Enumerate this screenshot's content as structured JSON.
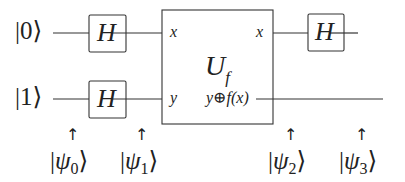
{
  "diagram": {
    "type": "quantum-circuit",
    "colors": {
      "line": "#333333",
      "text": "#222222",
      "background": "#ffffff"
    },
    "inputs": [
      {
        "ket": "|0⟩",
        "value": "0"
      },
      {
        "ket": "|1⟩",
        "value": "1"
      }
    ],
    "gates": [
      {
        "id": "h-top-1",
        "label": "H",
        "wire": 0
      },
      {
        "id": "h-bottom-1",
        "label": "H",
        "wire": 1
      },
      {
        "id": "uf",
        "label": "U",
        "subscript": "f",
        "inputs": [
          "x",
          "y"
        ],
        "outputs": [
          "x",
          "y⊕f(x)"
        ]
      },
      {
        "id": "h-top-2",
        "label": "H",
        "wire": 0
      }
    ],
    "states": [
      {
        "label": "ψ",
        "subscript": "0",
        "arrow": "↑"
      },
      {
        "label": "ψ",
        "subscript": "1",
        "arrow": "↑"
      },
      {
        "label": "ψ",
        "subscript": "2",
        "arrow": "↑"
      },
      {
        "label": "ψ",
        "subscript": "3",
        "arrow": "↑"
      }
    ]
  }
}
